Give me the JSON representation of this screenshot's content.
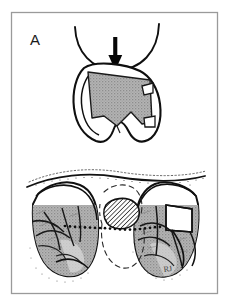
{
  "figure": {
    "panel_label": "A",
    "signature": "RJ",
    "background_color": "#ffffff",
    "frame": {
      "border_color": "#9a9a9a",
      "x": 11,
      "y": 12,
      "width": 207,
      "height": 282
    },
    "colors": {
      "ink": "#111111",
      "shade_gray": "#a9a9a9",
      "shade_gray_light": "#bdbdbd",
      "hatch_line": "#1a1a1a",
      "stipple": "#6e6e6e",
      "frame_border": "#9a9a9a"
    },
    "upper_illustration": {
      "name": "knee-cross-section",
      "description": "Cross-sectional view of knee joint with femoral condyle arc above and shaded meniscal defect below",
      "parts": [
        {
          "name": "femoral-condyle-arc",
          "label": ""
        },
        {
          "name": "down-arrow-marker",
          "label": ""
        },
        {
          "name": "meniscus-outline",
          "label": ""
        },
        {
          "name": "shaded-defect-region",
          "label": ""
        }
      ]
    },
    "lower_illustration": {
      "name": "tibial-plateau-superior-view",
      "description": "Superior view of tibial plateau showing medial and lateral menisci shaded, hatched intercondylar eminence and dotted midline axis",
      "parts": [
        {
          "name": "plateau-outline",
          "label": ""
        },
        {
          "name": "left-meniscus-shaded",
          "label": ""
        },
        {
          "name": "right-meniscus-shaded",
          "label": ""
        },
        {
          "name": "hatched-tibial-spine",
          "label": ""
        },
        {
          "name": "dotted-midline",
          "label": ""
        },
        {
          "name": "dashed-posterior-outline",
          "label": ""
        }
      ]
    }
  }
}
